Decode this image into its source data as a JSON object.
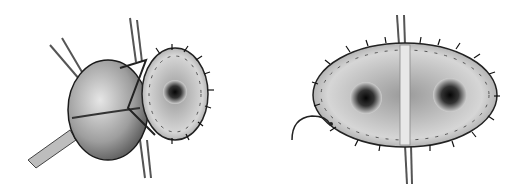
{
  "figure": {
    "panels": [
      {
        "id": "left",
        "subject": "bulbous valved conduit with sutured circular annulus, retracted by instruments"
      },
      {
        "id": "right",
        "subject": "oval sutured annulus divided by central strut showing two orifices, with curved suture needle"
      }
    ],
    "colors": {
      "background": "#ffffff",
      "tissue_light": "#d9d9d9",
      "tissue_mid": "#9a9a9a",
      "tissue_dark": "#2a2a2a",
      "outline": "#1a1a1a"
    }
  }
}
